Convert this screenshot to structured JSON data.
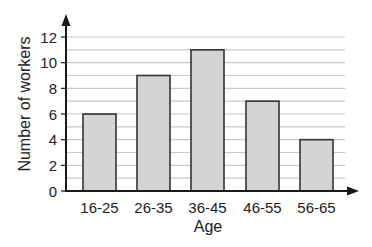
{
  "chart_data": {
    "type": "bar",
    "title": "",
    "xlabel": "Age",
    "ylabel": "Number of workers",
    "categories": [
      "16-25",
      "26-35",
      "36-45",
      "46-55",
      "56-65"
    ],
    "values": [
      6,
      9,
      11,
      7,
      4
    ],
    "ylim": [
      0,
      12
    ],
    "yticks": [
      0,
      2,
      4,
      6,
      8,
      10,
      12
    ],
    "minor_gridlines_every": 1,
    "grid": true,
    "legend": null,
    "colors": {
      "bar_fill": "#d4d4d4",
      "bar_stroke": "#333333",
      "grid": "#c8c8c8",
      "axis": "#1a1a1a"
    }
  }
}
